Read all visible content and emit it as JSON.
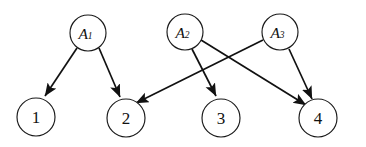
{
  "diagram": {
    "type": "bipartite-directed-graph",
    "title": "",
    "background_color": "#ffffff",
    "node_stroke_color": "#1a1a1a",
    "node_fill_color": "#ffffff",
    "edge_color": "#111111",
    "top_nodes": [
      {
        "id": "A1",
        "label_main": "A",
        "label_sub": "1",
        "cx": 88,
        "cy": 33,
        "r": 18
      },
      {
        "id": "A2",
        "label_main": "A",
        "label_sub": "2",
        "cx": 185,
        "cy": 32,
        "r": 18
      },
      {
        "id": "A3",
        "label_main": "A",
        "label_sub": "3",
        "cx": 280,
        "cy": 32,
        "r": 18
      }
    ],
    "bottom_nodes": [
      {
        "id": "n1",
        "label": "1",
        "cx": 36,
        "cy": 117,
        "r": 19
      },
      {
        "id": "n2",
        "label": "2",
        "cx": 126,
        "cy": 118,
        "r": 19
      },
      {
        "id": "n3",
        "label": "3",
        "cx": 221,
        "cy": 118,
        "r": 19
      },
      {
        "id": "n4",
        "label": "4",
        "cx": 318,
        "cy": 118,
        "r": 19
      }
    ],
    "edges": [
      {
        "id": "e-a1-n1",
        "from": "A1",
        "to": "n1",
        "x1": 77,
        "y1": 48,
        "x2": 45,
        "y2": 96
      },
      {
        "id": "e-a1-n2",
        "from": "A1",
        "to": "n2",
        "x1": 99,
        "y1": 48,
        "x2": 120,
        "y2": 97
      },
      {
        "id": "e-a2-n3",
        "from": "A2",
        "to": "n3",
        "x1": 192,
        "y1": 49,
        "x2": 216,
        "y2": 96
      },
      {
        "id": "e-a2-n4",
        "from": "A2",
        "to": "n4",
        "x1": 201,
        "y1": 40,
        "x2": 306,
        "y2": 105
      },
      {
        "id": "e-a3-n2",
        "from": "A3",
        "to": "n2",
        "x1": 263,
        "y1": 40,
        "x2": 136,
        "y2": 103
      },
      {
        "id": "e-a3-n4",
        "from": "A3",
        "to": "n4",
        "x1": 289,
        "y1": 49,
        "x2": 312,
        "y2": 99
      }
    ]
  }
}
